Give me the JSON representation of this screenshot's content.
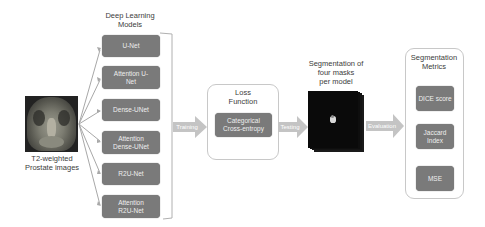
{
  "input": {
    "label_line1": "T2-weighted",
    "label_line2": "Prostate images"
  },
  "models": {
    "title_line1": "Deep Learning",
    "title_line2": "Models",
    "items": [
      {
        "line1": "U-Net",
        "line2": ""
      },
      {
        "line1": "Attention U-",
        "line2": "Net"
      },
      {
        "line1": "Dense-UNet",
        "line2": ""
      },
      {
        "line1": "Attention",
        "line2": "Dense-UNet"
      },
      {
        "line1": "R2U-Net",
        "line2": ""
      },
      {
        "line1": "Attention",
        "line2": "R2U-Net"
      }
    ]
  },
  "arrows": {
    "training": "Training",
    "testing": "Testing",
    "evaluation": "Evaluation"
  },
  "loss": {
    "title_line1": "Loss",
    "title_line2": "Function",
    "item_line1": "Categorical",
    "item_line2": "Cross-entropy"
  },
  "segmentation": {
    "label_line1": "Segmentation of",
    "label_line2": "four masks",
    "label_line3": "per model"
  },
  "metrics": {
    "title_line1": "Segmentation",
    "title_line2": "Metrics",
    "items": [
      {
        "line1": "DICE score",
        "line2": ""
      },
      {
        "line1": "Jaccard",
        "line2": "Index"
      },
      {
        "line1": "MSE",
        "line2": ""
      }
    ]
  },
  "colors": {
    "box_fill": "#7a7a7a",
    "arrow_fill": "#c4c4c4",
    "outline": "#c8c8c8",
    "mask_bg": "#0a0a0a"
  }
}
